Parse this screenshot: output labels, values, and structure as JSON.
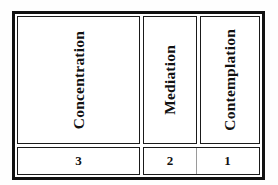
{
  "diagram": {
    "type": "three-column-table",
    "columns": [
      {
        "label": "Concentration",
        "number": "3"
      },
      {
        "label": "Mediation",
        "number": "2"
      },
      {
        "label": "Contemplation",
        "number": "1"
      }
    ],
    "colors": {
      "border": "#111111",
      "inner_border": "#1a1a1a",
      "light_divider": "#9a9a9a",
      "cell_background": "#ffffff",
      "page_background": "#fefefe",
      "text": "#111111"
    },
    "text_orientation": "vertical-bottom-to-top"
  }
}
